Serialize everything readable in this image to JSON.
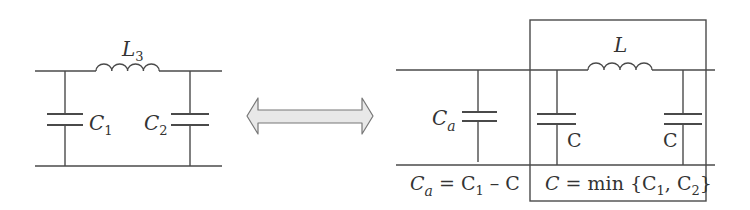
{
  "left_circuit": {
    "inductor_label": "L",
    "inductor_sub": "3",
    "cap1_label": "C",
    "cap1_sub": "1",
    "cap2_label": "C",
    "cap2_sub": "2"
  },
  "arrow": {
    "type": "double-headed",
    "meaning": "equivalent"
  },
  "right_circuit": {
    "ca_label": "C",
    "ca_sub": "a",
    "inductor_label": "L",
    "cap_left_label": "C",
    "cap_right_label": "C",
    "eq_left": {
      "lhs": "C",
      "lhs_sub": "a",
      "mid": " = C",
      "mid_sub": "1",
      "rhs": " – C"
    },
    "eq_right": {
      "lhs": "C",
      "mid": " = min {C",
      "sub1": "1",
      "sep": ", C",
      "sub2": "2",
      "end": "}"
    }
  },
  "colors": {
    "line": "#4a4a4a",
    "arrow_fill": "#e8e8e8",
    "arrow_stroke": "#777777"
  }
}
